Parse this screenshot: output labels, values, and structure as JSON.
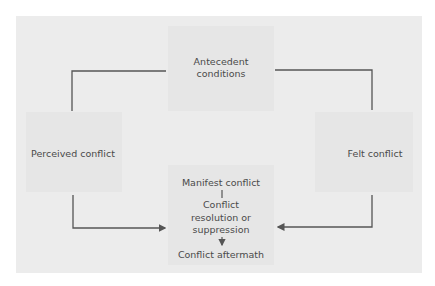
{
  "diagram": {
    "nodes": {
      "antecedent": {
        "line1": "Antecedent",
        "line2": "conditions"
      },
      "perceived": {
        "label": "Perceived conflict"
      },
      "felt": {
        "label": "Felt conflict"
      },
      "center": {
        "manifest": "Manifest conflict",
        "resolution_line1": "Conflict",
        "resolution_line2": "resolution or",
        "resolution_line3": "suppression",
        "aftermath": "Conflict aftermath"
      }
    },
    "edges": [
      {
        "from": "antecedent",
        "to": "perceived",
        "arrow": false
      },
      {
        "from": "antecedent",
        "to": "felt",
        "arrow": false
      },
      {
        "from": "perceived",
        "to": "center",
        "arrow": true
      },
      {
        "from": "felt",
        "to": "center",
        "arrow": true
      },
      {
        "from": "manifest",
        "to": "resolution",
        "arrow": false
      },
      {
        "from": "resolution",
        "to": "aftermath",
        "arrow": true
      }
    ],
    "colors": {
      "panel": "#ececec",
      "inner_box": "#e6e6e6",
      "line": "#555555",
      "text": "#4a4a4a"
    }
  }
}
